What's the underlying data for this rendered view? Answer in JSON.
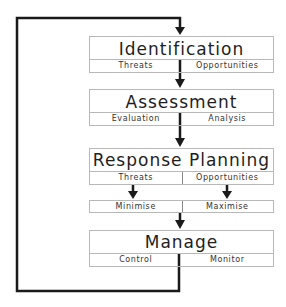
{
  "diagram": {
    "type": "risk-management-cycle",
    "stages": [
      {
        "id": "identification",
        "title": "Identification",
        "sub": [
          "Threats",
          "Opportunities"
        ]
      },
      {
        "id": "assessment",
        "title": "Assessment",
        "sub": [
          "Evaluation",
          "Analysis"
        ]
      },
      {
        "id": "response-planning",
        "title": "Response Planning",
        "sub": [
          "Threats",
          "Opportunities"
        ]
      },
      {
        "id": "response-actions",
        "sub": [
          "Minimise",
          "Maximise"
        ]
      },
      {
        "id": "manage",
        "title": "Manage",
        "sub": [
          "Control",
          "Monitor"
        ]
      }
    ],
    "feedback_loop": "Manage returns to Identification",
    "colors": {
      "line": "#1a1a1a",
      "box_border": "#b8b8b8",
      "text": "#1e1e1e"
    }
  }
}
